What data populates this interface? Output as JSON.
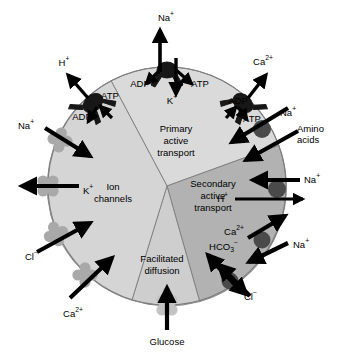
{
  "figure": {
    "geometry": {
      "center_x": 167,
      "center_y": 186,
      "radius": 119
    },
    "colors": {
      "sector_primary": "#d9d9d9",
      "sector_ion_channels": "#d3d3d3",
      "sector_secondary": "#b0b0b0",
      "sector_facilitated": "#cccccc",
      "outline": "#808080",
      "pump_dark": "#1a1a1a",
      "channel_gray": "#a8a8a8",
      "carrier_gray": "#8a8a8a",
      "glucose_carrier": "#c0c0c0",
      "arrow_black": "#000000",
      "text": "#000000",
      "background": "#ffffff"
    }
  },
  "sectors": [
    {
      "id": "primary-active-transport",
      "lines": [
        "Primary",
        "active",
        "transport"
      ],
      "label_x": 176,
      "label_y": 132
    },
    {
      "id": "secondary-active-transport",
      "lines": [
        "Secondary",
        "active",
        "transport"
      ],
      "label_x": 213,
      "label_y": 192
    },
    {
      "id": "ion-channels",
      "lines": [
        "Ion",
        "channels"
      ],
      "label_x": 113,
      "label_y": 190
    },
    {
      "id": "facilitated-diffusion",
      "lines": [
        "Facilitated",
        "diffusion"
      ],
      "label_x": 162,
      "label_y": 265
    }
  ],
  "pumps": [
    {
      "id": "h-atpase",
      "ion": "H",
      "ion_charge": "+",
      "energy_labels": [
        "ATP",
        "ADP"
      ]
    },
    {
      "id": "na-k-atpase",
      "ion_out": "Na",
      "ion_out_charge": "+",
      "ion_in": "K",
      "ion_in_charge": "+",
      "energy_labels": [
        "ADP",
        "ATP"
      ]
    },
    {
      "id": "ca-atpase",
      "ion": "Ca",
      "ion_charge": "2+",
      "energy_labels": [
        "ADP",
        "ATP"
      ]
    }
  ],
  "labels": {
    "h_plus_top_left": {
      "base": "H",
      "sup": "+",
      "x": 64,
      "y": 63
    },
    "atp_top_left": {
      "text": "ATP",
      "x": 110,
      "y": 96
    },
    "adp_top_left": {
      "text": "ADP",
      "x": 82,
      "y": 117
    },
    "na_plus_top": {
      "base": "Na",
      "sup": "+",
      "x": 166,
      "y": 18
    },
    "adp_top_center": {
      "text": "ADP",
      "x": 140,
      "y": 84
    },
    "atp_top_center": {
      "text": "ATP",
      "x": 200,
      "y": 84
    },
    "k_plus_top": {
      "base": "K",
      "sup": "+",
      "x": 172,
      "y": 101
    },
    "ca_2plus_top_right": {
      "base": "Ca",
      "sup": "2+",
      "x": 263,
      "y": 62
    },
    "adp_top_right": {
      "text": "ADP",
      "x": 238,
      "y": 101
    },
    "atp_top_right": {
      "text": "ATP",
      "x": 252,
      "y": 119
    },
    "na_plus_amino": {
      "base": "Na",
      "sup": "+",
      "x": 280,
      "y": 113
    },
    "amino_acids_line1": {
      "text": "Amino",
      "x": 306,
      "y": 129
    },
    "amino_acids_line2": {
      "text": "acids",
      "x": 306,
      "y": 139
    },
    "na_plus_exchanger": {
      "base": "Na",
      "sup": "+",
      "x": 307,
      "y": 185
    },
    "h_plus_exchanger": {
      "base": "H",
      "sup": "+",
      "x": 222,
      "y": 199
    },
    "ca_2plus_exchanger": {
      "base": "Ca",
      "sup": "2+",
      "x": 234,
      "y": 232
    },
    "na_plus_ca_exchanger": {
      "base": "Na",
      "sup": "+",
      "x": 291,
      "y": 245
    },
    "hco3_label": {
      "base": "HCO",
      "sub": "3",
      "sup": "−",
      "x": 225,
      "y": 245
    },
    "cl_minus_bottom_right": {
      "base": "Cl",
      "sup": "−",
      "x": 244,
      "y": 296
    },
    "glucose": {
      "text": "Glucose",
      "x": 167,
      "y": 342
    },
    "ca_2plus_bottom_left": {
      "base": "Ca",
      "sup": "2+",
      "x": 73,
      "y": 314
    },
    "cl_minus_left": {
      "base": "Cl",
      "sup": "−",
      "x": 31,
      "y": 257
    },
    "k_plus_left": {
      "base": "K",
      "sup": "+",
      "x": 86,
      "y": 191
    },
    "na_plus_left": {
      "base": "Na",
      "sup": "+",
      "x": 26,
      "y": 126
    }
  },
  "transporters": {
    "ion_channels": [
      {
        "id": "na-channel",
        "ion": "Na",
        "charge": "+",
        "direction": "inward"
      },
      {
        "id": "k-channel",
        "ion": "K",
        "charge": "+",
        "direction": "outward"
      },
      {
        "id": "cl-channel",
        "ion": "Cl",
        "charge": "−",
        "direction": "inward"
      },
      {
        "id": "ca-channel",
        "ion": "Ca",
        "charge": "2+",
        "direction": "inward"
      }
    ],
    "secondary": [
      {
        "id": "na-amino-cotransporter",
        "solutes": [
          "Na+",
          "Amino acids"
        ],
        "direction": "inward"
      },
      {
        "id": "na-h-exchanger",
        "solutes": [
          "Na+",
          "H+"
        ],
        "direction": "antiport"
      },
      {
        "id": "na-ca-exchanger",
        "solutes": [
          "Na+",
          "Ca2+"
        ],
        "direction": "antiport"
      },
      {
        "id": "cl-hco3-exchanger",
        "solutes": [
          "Cl−",
          "HCO3−"
        ],
        "direction": "antiport"
      }
    ],
    "facilitated": [
      {
        "id": "glucose-transporter",
        "solute": "Glucose",
        "direction": "inward"
      }
    ]
  }
}
